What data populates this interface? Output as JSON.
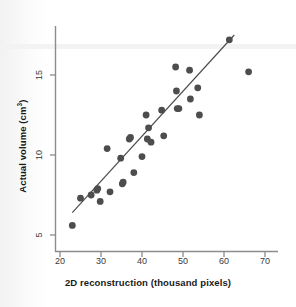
{
  "chart_data": {
    "type": "scatter",
    "title": "",
    "xlabel": "2D reconstruction (thousand pixels)",
    "ylabel": "Actual volume (cm³)",
    "ylabel_base": "Actual volume (cm",
    "ylabel_sup": "3",
    "ylabel_tail": ")",
    "xlim": [
      18,
      72
    ],
    "ylim": [
      4.2,
      17.8
    ],
    "xticks": [
      20,
      30,
      40,
      50,
      60,
      70
    ],
    "yticks": [
      5,
      10,
      15
    ],
    "xticklabels": [
      "20",
      "30",
      "40",
      "50",
      "60",
      "70"
    ],
    "yticklabels": [
      "5",
      "10",
      "15"
    ],
    "grid": false,
    "legend": null,
    "marker": {
      "shape": "circle",
      "color": "#4d4d4d",
      "size": 3.4
    },
    "points": [
      {
        "x": 23.0,
        "y": 5.6
      },
      {
        "x": 25.0,
        "y": 7.3
      },
      {
        "x": 27.6,
        "y": 7.5
      },
      {
        "x": 29.0,
        "y": 7.8
      },
      {
        "x": 29.2,
        "y": 7.9
      },
      {
        "x": 29.8,
        "y": 7.1
      },
      {
        "x": 31.5,
        "y": 10.4
      },
      {
        "x": 32.2,
        "y": 7.7
      },
      {
        "x": 34.8,
        "y": 9.8
      },
      {
        "x": 35.2,
        "y": 8.2
      },
      {
        "x": 35.4,
        "y": 8.3
      },
      {
        "x": 36.9,
        "y": 11.0
      },
      {
        "x": 37.2,
        "y": 11.1
      },
      {
        "x": 38.0,
        "y": 8.9
      },
      {
        "x": 40.0,
        "y": 9.9
      },
      {
        "x": 41.0,
        "y": 12.5
      },
      {
        "x": 41.3,
        "y": 11.0
      },
      {
        "x": 41.6,
        "y": 11.7
      },
      {
        "x": 42.2,
        "y": 10.8
      },
      {
        "x": 44.8,
        "y": 12.8
      },
      {
        "x": 45.3,
        "y": 11.2
      },
      {
        "x": 48.2,
        "y": 15.5
      },
      {
        "x": 48.4,
        "y": 14.0
      },
      {
        "x": 48.6,
        "y": 12.9
      },
      {
        "x": 49.0,
        "y": 12.9
      },
      {
        "x": 51.6,
        "y": 15.3
      },
      {
        "x": 51.8,
        "y": 13.5
      },
      {
        "x": 53.6,
        "y": 14.2
      },
      {
        "x": 54.0,
        "y": 12.5
      },
      {
        "x": 61.3,
        "y": 17.2
      },
      {
        "x": 66.0,
        "y": 15.2
      }
    ],
    "fit_line": {
      "label": "least-squares fit",
      "x_start": 23.0,
      "y_start": 6.4,
      "x_end": 62.5,
      "y_end": 17.5,
      "color": "#4d4d4d"
    }
  },
  "axes": {
    "x_axis_name": "x-axis",
    "y_axis_name": "y-axis",
    "spine_color": "#8c8c8c"
  }
}
